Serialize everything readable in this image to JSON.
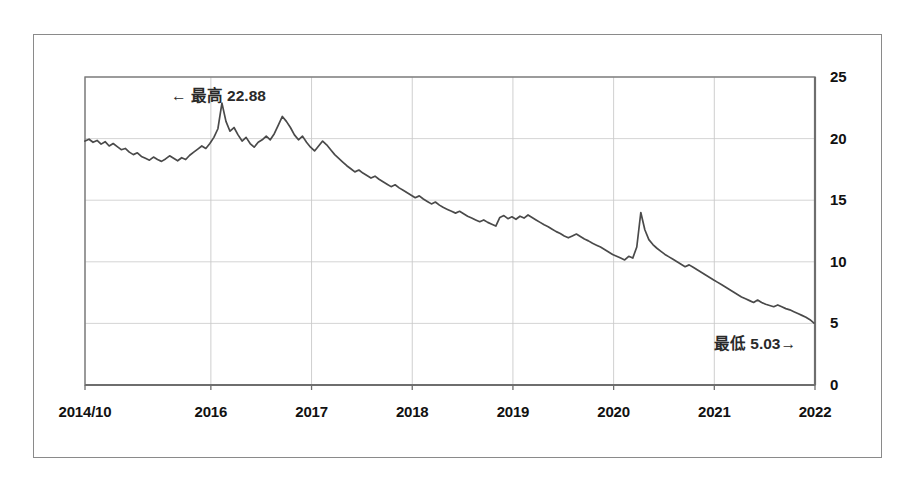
{
  "figure": {
    "frame_color": "#8a8a8a",
    "background": "#ffffff"
  },
  "chart_data": {
    "type": "line",
    "title": "",
    "subtitle": "",
    "xlabel": "",
    "ylabel": "",
    "grid": true,
    "legend": "none",
    "line_color": "#4a4a4a",
    "gridline_color": "#c9c9c9",
    "axis_color": "#6e6e6e",
    "y_axis_side": "right",
    "ylim": [
      0,
      25
    ],
    "yticks": [
      0,
      5,
      10,
      15,
      20,
      25
    ],
    "ytick_labels": [
      "0",
      "5",
      "10",
      "15",
      "20",
      "25"
    ],
    "xlim": [
      2014.75,
      2022.0
    ],
    "xticks": [
      2014.75,
      2016.0,
      2017.0,
      2018.0,
      2019.0,
      2020.0,
      2021.0,
      2022.0
    ],
    "xtick_labels": [
      "2014/10",
      "2016",
      "2017",
      "2018",
      "2019",
      "2020",
      "2021",
      "2022"
    ],
    "annotations": [
      {
        "name": "max-annotation",
        "arrow": "←",
        "label": "最高",
        "value": "22.88",
        "text": "← 最高 22.88"
      },
      {
        "name": "min-annotation",
        "arrow": "→",
        "label": "最低",
        "value": "5.03",
        "text": "最低 5.03→"
      }
    ],
    "max_value": 22.88,
    "min_value": 5.03,
    "x": [
      2014.75,
      2014.79,
      2014.83,
      2014.87,
      2014.91,
      2014.95,
      2014.99,
      2015.03,
      2015.07,
      2015.11,
      2015.15,
      2015.19,
      2015.23,
      2015.27,
      2015.31,
      2015.35,
      2015.39,
      2015.43,
      2015.47,
      2015.51,
      2015.55,
      2015.59,
      2015.63,
      2015.67,
      2015.71,
      2015.75,
      2015.79,
      2015.83,
      2015.87,
      2015.91,
      2015.95,
      2015.99,
      2016.03,
      2016.07,
      2016.11,
      2016.15,
      2016.19,
      2016.23,
      2016.27,
      2016.31,
      2016.35,
      2016.39,
      2016.43,
      2016.47,
      2016.51,
      2016.55,
      2016.59,
      2016.63,
      2016.67,
      2016.71,
      2016.75,
      2016.79,
      2016.83,
      2016.87,
      2016.91,
      2016.95,
      2016.99,
      2017.03,
      2017.07,
      2017.11,
      2017.15,
      2017.19,
      2017.23,
      2017.27,
      2017.31,
      2017.35,
      2017.39,
      2017.43,
      2017.47,
      2017.51,
      2017.55,
      2017.59,
      2017.63,
      2017.67,
      2017.71,
      2017.75,
      2017.79,
      2017.83,
      2017.87,
      2017.91,
      2017.95,
      2017.99,
      2018.03,
      2018.07,
      2018.11,
      2018.15,
      2018.19,
      2018.23,
      2018.27,
      2018.31,
      2018.35,
      2018.39,
      2018.43,
      2018.47,
      2018.51,
      2018.55,
      2018.59,
      2018.63,
      2018.67,
      2018.71,
      2018.75,
      2018.79,
      2018.83,
      2018.87,
      2018.91,
      2018.95,
      2018.99,
      2019.03,
      2019.07,
      2019.11,
      2019.15,
      2019.19,
      2019.23,
      2019.27,
      2019.31,
      2019.35,
      2019.39,
      2019.43,
      2019.47,
      2019.51,
      2019.55,
      2019.59,
      2019.63,
      2019.67,
      2019.71,
      2019.75,
      2019.79,
      2019.83,
      2019.87,
      2019.91,
      2019.95,
      2019.99,
      2020.03,
      2020.07,
      2020.11,
      2020.15,
      2020.19,
      2020.23,
      2020.27,
      2020.31,
      2020.35,
      2020.39,
      2020.43,
      2020.47,
      2020.51,
      2020.55,
      2020.59,
      2020.63,
      2020.67,
      2020.71,
      2020.75,
      2020.79,
      2020.83,
      2020.87,
      2020.91,
      2020.95,
      2020.99,
      2021.03,
      2021.07,
      2021.11,
      2021.15,
      2021.19,
      2021.23,
      2021.27,
      2021.31,
      2021.35,
      2021.39,
      2021.43,
      2021.47,
      2021.51,
      2021.55,
      2021.59,
      2021.63,
      2021.67,
      2021.71,
      2021.75,
      2021.79,
      2021.83,
      2021.87,
      2021.91,
      2021.95,
      2021.99
    ],
    "values": [
      19.8,
      19.95,
      19.7,
      19.85,
      19.55,
      19.75,
      19.4,
      19.6,
      19.35,
      19.1,
      19.2,
      18.9,
      18.7,
      18.85,
      18.55,
      18.4,
      18.25,
      18.5,
      18.3,
      18.15,
      18.35,
      18.6,
      18.4,
      18.2,
      18.45,
      18.3,
      18.65,
      18.9,
      19.15,
      19.4,
      19.2,
      19.6,
      20.1,
      20.8,
      22.88,
      21.4,
      20.6,
      20.9,
      20.3,
      19.8,
      20.1,
      19.6,
      19.3,
      19.7,
      19.9,
      20.2,
      19.9,
      20.4,
      21.1,
      21.8,
      21.4,
      20.9,
      20.3,
      19.9,
      20.2,
      19.7,
      19.3,
      19.0,
      19.4,
      19.8,
      19.5,
      19.1,
      18.7,
      18.4,
      18.1,
      17.8,
      17.55,
      17.3,
      17.45,
      17.2,
      17.0,
      16.8,
      16.95,
      16.7,
      16.5,
      16.3,
      16.1,
      16.25,
      16.0,
      15.8,
      15.6,
      15.4,
      15.2,
      15.35,
      15.1,
      14.9,
      14.7,
      14.85,
      14.6,
      14.4,
      14.25,
      14.1,
      13.95,
      14.1,
      13.9,
      13.7,
      13.55,
      13.4,
      13.25,
      13.4,
      13.2,
      13.05,
      12.9,
      13.6,
      13.75,
      13.5,
      13.65,
      13.45,
      13.7,
      13.55,
      13.8,
      13.6,
      13.4,
      13.2,
      13.0,
      12.85,
      12.65,
      12.45,
      12.3,
      12.1,
      11.95,
      12.1,
      12.25,
      12.05,
      11.85,
      11.7,
      11.5,
      11.35,
      11.2,
      11.0,
      10.8,
      10.6,
      10.45,
      10.3,
      10.15,
      10.45,
      10.3,
      11.2,
      14.0,
      12.6,
      11.8,
      11.4,
      11.1,
      10.85,
      10.6,
      10.4,
      10.2,
      10.0,
      9.8,
      9.6,
      9.75,
      9.55,
      9.35,
      9.15,
      8.95,
      8.75,
      8.55,
      8.35,
      8.15,
      7.95,
      7.75,
      7.55,
      7.35,
      7.15,
      7.0,
      6.85,
      6.7,
      6.9,
      6.7,
      6.55,
      6.45,
      6.35,
      6.5,
      6.35,
      6.2,
      6.1,
      5.95,
      5.8,
      5.65,
      5.5,
      5.3,
      5.03
    ]
  }
}
